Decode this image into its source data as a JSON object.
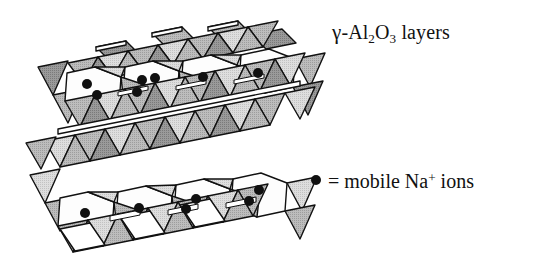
{
  "figure": {
    "title_label": "γ-Al2O3 layers",
    "legend_label": "= mobile Na+ ions",
    "annotations": {
      "layers": {
        "gamma": "γ",
        "dash": "-",
        "al": "Al",
        "al_sub": "2",
        "o": "O",
        "o_sub": "3",
        "word": "layers"
      },
      "legend": {
        "equals": "=",
        "text_before": "mobile Na",
        "charge": "+",
        "text_after": "ions"
      }
    },
    "colors": {
      "background": "#ffffff",
      "outline": "#111111",
      "face_light": "#d9d9d9",
      "face_mid": "#b4b4b4",
      "face_dark": "#8e8e8e",
      "void_white": "#fdfdfd",
      "ion_dot": "#101010",
      "text": "#111111"
    },
    "structure": {
      "type": "beta-alumina crystal polyhedral model",
      "conduction_planes": 2,
      "top_plane_voids": [
        {
          "index": 1,
          "cx": 92,
          "cy": 88,
          "ions": 2
        },
        {
          "index": 2,
          "cx": 152,
          "cy": 82,
          "ions": 3
        },
        {
          "index": 3,
          "cx": 210,
          "cy": 76,
          "ions": 1
        },
        {
          "index": 4,
          "cx": 268,
          "cy": 70,
          "ions": 1
        }
      ],
      "bottom_plane_voids": [
        {
          "index": 1,
          "cx": 85,
          "cy": 213,
          "ions": 1
        },
        {
          "index": 2,
          "cx": 143,
          "cy": 207,
          "ions": 1
        },
        {
          "index": 3,
          "cx": 199,
          "cy": 200,
          "ions": 2
        },
        {
          "index": 4,
          "cx": 256,
          "cy": 194,
          "ions": 2
        }
      ],
      "ion_radius": 5
    }
  }
}
